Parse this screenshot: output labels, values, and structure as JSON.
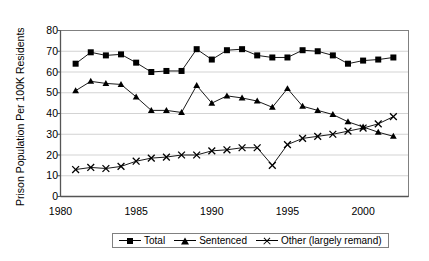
{
  "chart_data": {
    "type": "line",
    "title": "",
    "xlabel": "",
    "ylabel": "Prison Population Per 100K Residents",
    "xlim": [
      1980,
      2003
    ],
    "ylim": [
      0,
      80
    ],
    "ytick_labels": [
      "0",
      "10",
      "20",
      "30",
      "40",
      "50",
      "60",
      "70",
      "80"
    ],
    "ytick_values": [
      0,
      10,
      20,
      30,
      40,
      50,
      60,
      70,
      80
    ],
    "xtick_labels": [
      "1980",
      "1985",
      "1990",
      "1995",
      "2000"
    ],
    "xtick_values": [
      1980,
      1985,
      1990,
      1995,
      2000
    ],
    "grid": "horizontal",
    "legend_position": "bottom",
    "x": [
      1981,
      1982,
      1983,
      1984,
      1985,
      1986,
      1987,
      1988,
      1989,
      1990,
      1991,
      1992,
      1993,
      1994,
      1995,
      1996,
      1997,
      1998,
      1999,
      2000,
      2001,
      2002
    ],
    "series": [
      {
        "name": "Total",
        "marker": "square",
        "values": [
          64,
          69.5,
          68,
          68.5,
          64.5,
          60,
          60.5,
          60.5,
          71,
          66,
          70.5,
          71,
          68,
          67,
          67,
          70.5,
          70,
          68,
          64,
          65.5,
          66,
          67
        ]
      },
      {
        "name": "Sentenced",
        "marker": "triangle",
        "values": [
          51,
          55.5,
          54.5,
          54,
          48,
          41.5,
          41.5,
          40.5,
          53.5,
          45,
          48.5,
          47.5,
          46,
          43,
          52,
          43.5,
          41.5,
          39.5,
          36,
          33.5,
          31,
          29
        ]
      },
      {
        "name": "Other (largely remand)",
        "marker": "x",
        "values": [
          13,
          14,
          13.5,
          14.5,
          17,
          18.5,
          19,
          20,
          20,
          22,
          22.5,
          23.5,
          23.5,
          15,
          25,
          28,
          29,
          30,
          31.5,
          33,
          35,
          38.5
        ]
      }
    ]
  },
  "legend": {
    "items": [
      {
        "label": "Total"
      },
      {
        "label": "Sentenced"
      },
      {
        "label": "Other (largely remand)"
      }
    ]
  }
}
